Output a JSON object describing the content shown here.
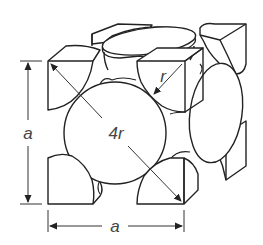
{
  "diagram": {
    "labels": {
      "edge_vertical": "a",
      "edge_horizontal": "a",
      "face_diagonal": "4r",
      "radius": "r"
    },
    "components": [
      "corner atom eighth-spheres (8)",
      "face-centered atom half-spheres (6, 3 visible: front, top, right)",
      "face diagonal arrow spanning 4r",
      "radius arrow r on top-right front corner",
      "vertical dimension line a",
      "horizontal dimension line a"
    ],
    "colors": {
      "line": "#222222",
      "fill": "#ffffff",
      "label": "#444444"
    }
  }
}
